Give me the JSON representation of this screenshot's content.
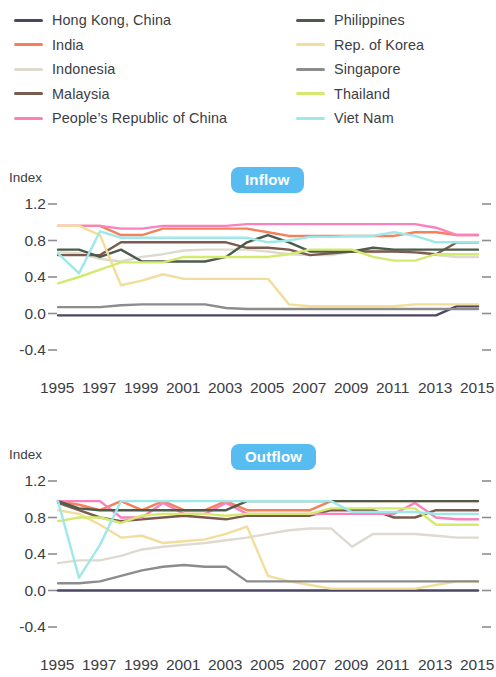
{
  "legend": {
    "columns": [
      {
        "items": [
          {
            "label": "Hong Kong, China",
            "color": "#4b4763"
          },
          {
            "label": "India",
            "color": "#f4815c"
          },
          {
            "label": "Indonesia",
            "color": "#dedacf"
          },
          {
            "label": "Malaysia",
            "color": "#7a5b4d"
          },
          {
            "label": "People’s Republic of China",
            "color": "#f982bd"
          }
        ]
      },
      {
        "items": [
          {
            "label": "Philippines",
            "color": "#4d5b4c"
          },
          {
            "label": "Rep. of Korea",
            "color": "#f2dd9a"
          },
          {
            "label": "Singapore",
            "color": "#8c8c8c"
          },
          {
            "label": "Thailand",
            "color": "#d4ea6e"
          },
          {
            "label": "Viet Nam",
            "color": "#9fe8e8"
          }
        ]
      }
    ]
  },
  "accent_color": "#57bdf0",
  "axis": {
    "ylabel": "Index",
    "yticks": [
      "1.2",
      "0.8",
      "0.4",
      "0.0",
      "-0.4"
    ],
    "yvalues": [
      1.2,
      0.8,
      0.4,
      0.0,
      -0.4
    ],
    "ylim": [
      -0.4,
      1.2
    ],
    "xticks": [
      "1995",
      "1997",
      "1999",
      "2001",
      "2003",
      "2005",
      "2007",
      "2009",
      "2011",
      "2013",
      "2015"
    ],
    "xlim": [
      1995,
      2015
    ]
  },
  "panels": [
    {
      "id": "inflow",
      "title": "Inflow"
    },
    {
      "id": "outflow",
      "title": "Outflow"
    }
  ],
  "chart_data": [
    {
      "type": "line",
      "title": "Inflow",
      "xlabel": "",
      "ylabel": "Index",
      "ylim": [
        -0.4,
        1.2
      ],
      "xlim": [
        1995,
        2015
      ],
      "grid": false,
      "legend_position": "top",
      "x": [
        1995,
        1996,
        1997,
        1998,
        1999,
        2000,
        2001,
        2002,
        2003,
        2004,
        2005,
        2006,
        2007,
        2008,
        2009,
        2010,
        2011,
        2012,
        2013,
        2014,
        2015
      ],
      "series": [
        {
          "name": "Hong Kong, China",
          "color": "#4b4763",
          "values": [
            -0.02,
            -0.02,
            -0.02,
            -0.02,
            -0.02,
            -0.02,
            -0.02,
            -0.02,
            -0.02,
            -0.02,
            -0.02,
            -0.02,
            -0.02,
            -0.02,
            -0.02,
            -0.02,
            -0.02,
            -0.02,
            -0.02,
            0.08,
            0.08
          ]
        },
        {
          "name": "India",
          "color": "#f4815c",
          "values": [
            0.96,
            0.96,
            0.96,
            0.86,
            0.86,
            0.93,
            0.93,
            0.93,
            0.93,
            0.93,
            0.89,
            0.85,
            0.85,
            0.85,
            0.85,
            0.85,
            0.85,
            0.89,
            0.89,
            0.86,
            0.86
          ]
        },
        {
          "name": "Indonesia",
          "color": "#dedacf",
          "values": [
            0.67,
            0.66,
            0.6,
            0.57,
            0.62,
            0.65,
            0.69,
            0.7,
            0.7,
            0.7,
            0.68,
            0.65,
            0.64,
            0.64,
            0.68,
            0.67,
            0.68,
            0.7,
            0.64,
            0.62,
            0.62
          ]
        },
        {
          "name": "Malaysia",
          "color": "#7a5b4d",
          "values": [
            0.64,
            0.64,
            0.64,
            0.78,
            0.78,
            0.78,
            0.78,
            0.78,
            0.78,
            0.72,
            0.72,
            0.7,
            0.64,
            0.66,
            0.68,
            0.68,
            0.68,
            0.67,
            0.65,
            0.78,
            0.78
          ]
        },
        {
          "name": "People’s Republic of China",
          "color": "#f982bd",
          "values": [
            0.96,
            0.96,
            0.96,
            0.93,
            0.93,
            0.96,
            0.96,
            0.96,
            0.96,
            0.98,
            0.98,
            0.98,
            0.98,
            0.98,
            0.98,
            0.98,
            0.98,
            0.98,
            0.94,
            0.86,
            0.86
          ]
        },
        {
          "name": "Philippines",
          "color": "#4d5b4c",
          "values": [
            0.7,
            0.7,
            0.62,
            0.7,
            0.57,
            0.57,
            0.57,
            0.57,
            0.62,
            0.78,
            0.86,
            0.78,
            0.68,
            0.68,
            0.68,
            0.72,
            0.7,
            0.7,
            0.7,
            0.7,
            0.7
          ]
        },
        {
          "name": "Rep. of Korea",
          "color": "#f2dd9a",
          "values": [
            0.96,
            0.96,
            0.86,
            0.31,
            0.36,
            0.43,
            0.38,
            0.38,
            0.38,
            0.38,
            0.38,
            0.1,
            0.08,
            0.08,
            0.08,
            0.08,
            0.08,
            0.1,
            0.1,
            0.1,
            0.1
          ]
        },
        {
          "name": "Singapore",
          "color": "#8c8c8c",
          "values": [
            0.07,
            0.07,
            0.07,
            0.09,
            0.1,
            0.1,
            0.1,
            0.1,
            0.06,
            0.05,
            0.05,
            0.05,
            0.05,
            0.05,
            0.05,
            0.05,
            0.05,
            0.05,
            0.05,
            0.05,
            0.05
          ]
        },
        {
          "name": "Thailand",
          "color": "#d4ea6e",
          "values": [
            0.33,
            0.4,
            0.48,
            0.56,
            0.56,
            0.56,
            0.62,
            0.62,
            0.62,
            0.62,
            0.62,
            0.65,
            0.7,
            0.7,
            0.7,
            0.62,
            0.58,
            0.58,
            0.65,
            0.65,
            0.65
          ]
        },
        {
          "name": "Viet Nam",
          "color": "#9fe8e8",
          "values": [
            0.66,
            0.44,
            0.9,
            0.83,
            0.83,
            0.83,
            0.83,
            0.83,
            0.83,
            0.83,
            0.78,
            0.8,
            0.84,
            0.84,
            0.85,
            0.85,
            0.89,
            0.85,
            0.78,
            0.78,
            0.78
          ]
        }
      ]
    },
    {
      "type": "line",
      "title": "Outflow",
      "xlabel": "",
      "ylabel": "Index",
      "ylim": [
        -0.4,
        1.2
      ],
      "xlim": [
        1995,
        2015
      ],
      "grid": false,
      "legend_position": "top",
      "x": [
        1995,
        1996,
        1997,
        1998,
        1999,
        2000,
        2001,
        2002,
        2003,
        2004,
        2005,
        2006,
        2007,
        2008,
        2009,
        2010,
        2011,
        2012,
        2013,
        2014,
        2015
      ],
      "series": [
        {
          "name": "Hong Kong, China",
          "color": "#4b4763",
          "values": [
            0.0,
            0.0,
            0.0,
            0.0,
            0.0,
            0.0,
            0.0,
            0.0,
            0.0,
            0.0,
            0.0,
            0.0,
            0.0,
            0.0,
            0.0,
            0.0,
            0.0,
            0.0,
            0.0,
            0.0,
            0.0
          ]
        },
        {
          "name": "India",
          "color": "#f4815c",
          "values": [
            0.98,
            0.94,
            0.88,
            0.98,
            0.88,
            0.98,
            0.88,
            0.88,
            0.98,
            0.88,
            0.88,
            0.88,
            0.88,
            0.98,
            0.98,
            0.98,
            0.98,
            0.98,
            0.98,
            0.98,
            0.98
          ]
        },
        {
          "name": "Indonesia",
          "color": "#dedacf",
          "values": [
            0.3,
            0.33,
            0.33,
            0.38,
            0.45,
            0.48,
            0.5,
            0.52,
            0.55,
            0.58,
            0.62,
            0.66,
            0.68,
            0.68,
            0.48,
            0.62,
            0.62,
            0.62,
            0.6,
            0.58,
            0.58
          ]
        },
        {
          "name": "Malaysia",
          "color": "#7a5b4d",
          "values": [
            0.96,
            0.88,
            0.8,
            0.76,
            0.78,
            0.8,
            0.82,
            0.8,
            0.78,
            0.82,
            0.82,
            0.82,
            0.82,
            0.88,
            0.88,
            0.88,
            0.8,
            0.8,
            0.88,
            0.88,
            0.88
          ]
        },
        {
          "name": "People’s Republic of China",
          "color": "#f982bd",
          "values": [
            0.98,
            0.98,
            0.98,
            0.8,
            0.8,
            0.96,
            0.84,
            0.84,
            0.96,
            0.84,
            0.84,
            0.84,
            0.84,
            0.84,
            0.84,
            0.84,
            0.84,
            0.96,
            0.8,
            0.78,
            0.78
          ]
        },
        {
          "name": "Philippines",
          "color": "#4d5b4c",
          "values": [
            0.98,
            0.9,
            0.88,
            0.88,
            0.88,
            0.88,
            0.88,
            0.88,
            0.88,
            0.98,
            0.98,
            0.98,
            0.98,
            0.98,
            0.98,
            0.98,
            0.98,
            0.98,
            0.98,
            0.98,
            0.98
          ]
        },
        {
          "name": "Rep. of Korea",
          "color": "#f2dd9a",
          "values": [
            0.88,
            0.84,
            0.72,
            0.58,
            0.6,
            0.52,
            0.54,
            0.56,
            0.62,
            0.7,
            0.16,
            0.1,
            0.06,
            0.02,
            0.02,
            0.02,
            0.02,
            0.02,
            0.06,
            0.1,
            0.1
          ]
        },
        {
          "name": "Singapore",
          "color": "#8c8c8c",
          "values": [
            0.08,
            0.08,
            0.1,
            0.16,
            0.22,
            0.26,
            0.28,
            0.26,
            0.26,
            0.1,
            0.1,
            0.1,
            0.1,
            0.1,
            0.1,
            0.1,
            0.1,
            0.1,
            0.1,
            0.1,
            0.1
          ]
        },
        {
          "name": "Thailand",
          "color": "#d4ea6e",
          "values": [
            0.76,
            0.8,
            0.8,
            0.74,
            0.82,
            0.84,
            0.84,
            0.84,
            0.82,
            0.84,
            0.84,
            0.84,
            0.84,
            0.9,
            0.9,
            0.9,
            0.9,
            0.9,
            0.72,
            0.72,
            0.72
          ]
        },
        {
          "name": "Viet Nam",
          "color": "#9fe8e8",
          "values": [
            0.98,
            0.14,
            0.5,
            0.98,
            0.98,
            0.98,
            0.98,
            0.98,
            0.98,
            0.98,
            0.98,
            0.98,
            0.98,
            0.98,
            0.86,
            0.86,
            0.86,
            0.86,
            0.84,
            0.84,
            0.84
          ]
        }
      ]
    }
  ]
}
